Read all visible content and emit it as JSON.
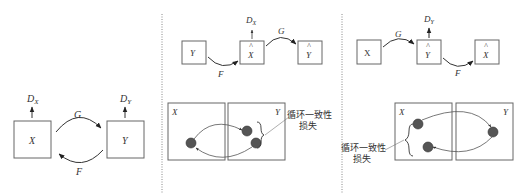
{
  "panels": [
    {
      "id": "panel-a",
      "boxes": {
        "left": "X",
        "right": "Y"
      },
      "discriminators": {
        "left": "D",
        "left_sub": "X",
        "right": "D",
        "right_sub": "Y"
      },
      "arrows": {
        "top": "G",
        "bottom": "F"
      }
    },
    {
      "id": "panel-b",
      "chain": {
        "box1": "Y",
        "box2": "X",
        "box2_hat": "^",
        "box3": "Y",
        "box3_hat": "^"
      },
      "discriminator": {
        "label": "D",
        "sub": "X"
      },
      "arrows": {
        "first": "F",
        "second": "G"
      },
      "domains": {
        "left": "X",
        "right": "Y"
      },
      "annotation": {
        "line1": "循环一致性",
        "line2": "损失"
      }
    },
    {
      "id": "panel-c",
      "chain": {
        "box1": "X",
        "box2": "Y",
        "box2_hat": "^",
        "box3": "X",
        "box3_hat": "^"
      },
      "discriminator": {
        "label": "D",
        "sub": "Y"
      },
      "arrows": {
        "first": "G",
        "second": "F"
      },
      "domains": {
        "left": "X",
        "right": "Y"
      },
      "annotation": {
        "line1": "循环一致性",
        "line2": "损失"
      }
    }
  ]
}
